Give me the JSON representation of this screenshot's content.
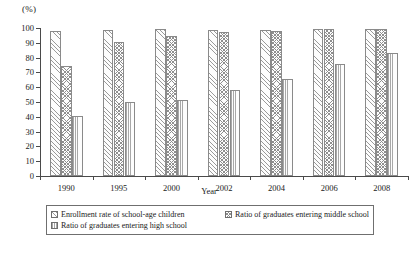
{
  "chart_data": {
    "type": "bar",
    "title": "",
    "subtitle": "",
    "unit_label": "(%)",
    "xlabel": "Year",
    "ylabel": "",
    "categories": [
      "1990",
      "1995",
      "2000",
      "2002",
      "2004",
      "2006",
      "2008"
    ],
    "series": [
      {
        "name": "Enrollment rate of school-age children",
        "pattern": "diagonal-hatch",
        "values": [
          97.8,
          98.5,
          99.1,
          98.6,
          98.9,
          99.3,
          99.5
        ]
      },
      {
        "name": "Ratio of graduates entering middle school",
        "pattern": "cross-hatch",
        "values": [
          74.6,
          90.8,
          94.9,
          97.0,
          98.1,
          99.0,
          99.1
        ]
      },
      {
        "name": "Ratio of graduates entering high school",
        "pattern": "vertical-lines",
        "values": [
          40.6,
          50.0,
          51.1,
          58.3,
          65.7,
          75.7,
          83.4
        ]
      }
    ],
    "ylim": [
      0,
      100
    ],
    "yticks": [
      0,
      10,
      20,
      30,
      40,
      50,
      60,
      70,
      80,
      90,
      100
    ],
    "ytick_labels": [
      "0",
      "10",
      "20",
      "30",
      "40",
      "50",
      "60",
      "70",
      "80",
      "90",
      "100"
    ],
    "grid": false,
    "legend_position": "bottom",
    "colors": {
      "axis": "#4a4a4a",
      "bar_edge": "#8a8a8a",
      "hatch": "#9a9a9a",
      "legend_border": "#6f6f6f",
      "background": "#ffffff"
    }
  },
  "legend": {
    "items": [
      {
        "label": "Enrollment rate of school-age children",
        "swatch": "diagonal-hatch-swatch"
      },
      {
        "label": "Ratio of graduates entering middle school",
        "swatch": "cross-hatch-swatch"
      },
      {
        "label": "Ratio of graduates entering high school",
        "swatch": "vertical-lines-swatch"
      }
    ]
  }
}
